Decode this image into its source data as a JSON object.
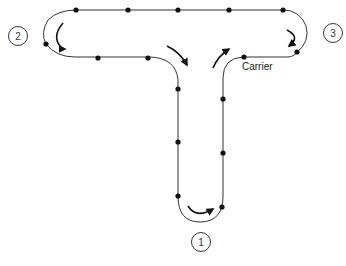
{
  "diagram": {
    "type": "conveyor-loop",
    "stroke_color": "#333333",
    "dot_color": "#111111",
    "carrier_label": "Carrier",
    "stations": [
      {
        "id": "1",
        "label": "1"
      },
      {
        "id": "2",
        "label": "2"
      },
      {
        "id": "3",
        "label": "3"
      }
    ],
    "carrier_count": 16,
    "flow_arrows": [
      "station-2-loop-counterclockwise",
      "junction-down-left",
      "junction-up-right",
      "station-3-loop-clockwise",
      "station-1-loop-right"
    ]
  }
}
